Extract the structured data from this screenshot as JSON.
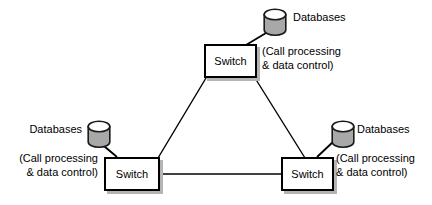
{
  "diagram": {
    "colors": {
      "line": "#000000",
      "box_fill": "#ffffff",
      "box_border": "#000000",
      "box_shadow": "#b4b4b4",
      "cylinder_body": "#a8a8a8",
      "cylinder_top": "#ffffff",
      "cylinder_outline": "#1a1a1a",
      "text": "#000000",
      "background": "#ffffff"
    },
    "nodes": {
      "top_switch": {
        "label": "Switch"
      },
      "left_switch": {
        "label": "Switch"
      },
      "right_switch": {
        "label": "Switch"
      }
    },
    "databases": {
      "top": {
        "label": "Databases"
      },
      "left": {
        "label": "Databases"
      },
      "right": {
        "label": "Databases"
      }
    },
    "annotations": {
      "top": {
        "line1": "(Call processing",
        "line2": "& data control)"
      },
      "left": {
        "line1": "(Call processing",
        "line2": "& data control)"
      },
      "right": {
        "line1": "(Call processing",
        "line2": "& data control)"
      }
    }
  }
}
